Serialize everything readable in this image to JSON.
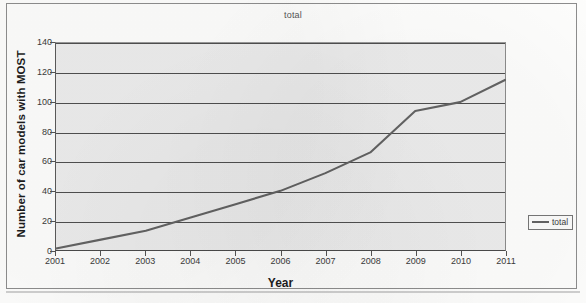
{
  "chart_data": {
    "type": "line",
    "title": "total",
    "xlabel": "Year",
    "ylabel": "Number of car models with MOST",
    "x": [
      2001,
      2002,
      2003,
      2004,
      2005,
      2006,
      2007,
      2008,
      2009,
      2010,
      2011
    ],
    "categories": [
      "2001",
      "2002",
      "2003",
      "2004",
      "2005",
      "2006",
      "2007",
      "2008",
      "2009",
      "2010",
      "2011"
    ],
    "series": [
      {
        "name": "total",
        "values": [
          1,
          7,
          13,
          22,
          31,
          40,
          52,
          66,
          94,
          100,
          115
        ],
        "color": "#636363"
      }
    ],
    "ylim": [
      0,
      140
    ],
    "yticks": [
      0,
      20,
      40,
      60,
      80,
      100,
      120,
      140
    ],
    "ytick_labels": [
      "0",
      "20",
      "40",
      "60",
      "80",
      "100",
      "120",
      "140"
    ],
    "xlim": [
      2001,
      2011
    ],
    "grid": "horizontal",
    "plot_background": "#ececec",
    "legend": {
      "position": "right",
      "entries": [
        {
          "label": "total",
          "marker": "line",
          "color": "#636363"
        }
      ]
    }
  }
}
